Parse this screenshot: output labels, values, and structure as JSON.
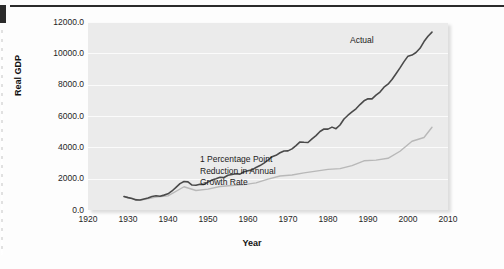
{
  "chart_data": {
    "type": "line",
    "title": "",
    "xlabel": "Year",
    "ylabel": "Real GDP",
    "xlim": [
      1920,
      2010
    ],
    "ylim": [
      0,
      12000
    ],
    "grid": "horizontal",
    "legend": "none",
    "xticks": [
      "1920",
      "1930",
      "1940",
      "1950",
      "1960",
      "1970",
      "1980",
      "1990",
      "2000",
      "2010"
    ],
    "yticks": [
      "0.0",
      "2000.0",
      "4000.0",
      "6000.0",
      "8000.0",
      "10000.0",
      "12000.0"
    ],
    "annotations": [
      {
        "name": "actual",
        "text": "Actual"
      },
      {
        "name": "counterfactual",
        "line1": "1 Percentage Point",
        "line2": "Reduction in Annual",
        "line3": "Growth Rate"
      }
    ],
    "series": [
      {
        "name": "Actual",
        "color": "#4a4a4a",
        "x": [
          1929,
          1930,
          1931,
          1932,
          1933,
          1934,
          1935,
          1936,
          1937,
          1938,
          1939,
          1940,
          1941,
          1942,
          1943,
          1944,
          1945,
          1946,
          1947,
          1948,
          1949,
          1950,
          1951,
          1952,
          1953,
          1954,
          1955,
          1956,
          1957,
          1958,
          1959,
          1960,
          1961,
          1962,
          1963,
          1964,
          1965,
          1966,
          1967,
          1968,
          1969,
          1970,
          1971,
          1972,
          1973,
          1974,
          1975,
          1976,
          1977,
          1978,
          1979,
          1980,
          1981,
          1982,
          1983,
          1984,
          1985,
          1986,
          1987,
          1988,
          1989,
          1990,
          1991,
          1992,
          1993,
          1994,
          1995,
          1996,
          1997,
          1998,
          1999,
          2000,
          2001,
          2002,
          2003,
          2004,
          2005,
          2006
        ],
        "values": [
          865,
          790,
          740,
          645,
          635,
          705,
          765,
          865,
          910,
          880,
          950,
          1035,
          1215,
          1445,
          1685,
          1815,
          1795,
          1595,
          1580,
          1645,
          1635,
          1780,
          1920,
          1995,
          2090,
          2075,
          2220,
          2265,
          2310,
          2290,
          2440,
          2500,
          2560,
          2715,
          2835,
          2995,
          3190,
          3400,
          3490,
          3655,
          3770,
          3775,
          3900,
          4110,
          4345,
          4320,
          4310,
          4540,
          4750,
          5010,
          5170,
          5160,
          5290,
          5190,
          5425,
          5810,
          6050,
          6260,
          6460,
          6730,
          6970,
          7100,
          7090,
          7330,
          7530,
          7840,
          8030,
          8330,
          8700,
          9070,
          9470,
          9820,
          9890,
          10050,
          10320,
          10750,
          11090,
          11350
        ]
      },
      {
        "name": "1 Percentage Point Reduction in Annual Growth Rate",
        "color": "#b8b8b8",
        "x": [
          1929,
          1933,
          1937,
          1940,
          1944,
          1947,
          1950,
          1953,
          1956,
          1959,
          1962,
          1965,
          1968,
          1971,
          1974,
          1977,
          1980,
          1983,
          1986,
          1989,
          1992,
          1995,
          1998,
          2001,
          2004,
          2006
        ],
        "values": [
          865,
          610,
          825,
          900,
          1485,
          1245,
          1335,
          1500,
          1560,
          1620,
          1735,
          1975,
          2170,
          2230,
          2370,
          2485,
          2590,
          2640,
          2830,
          3140,
          3185,
          3300,
          3750,
          4390,
          4630,
          5280
        ]
      }
    ]
  }
}
